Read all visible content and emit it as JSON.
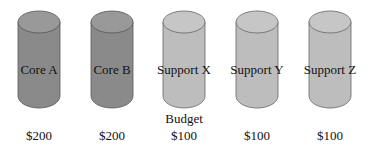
{
  "items": [
    {
      "label": "Core A",
      "amount": "$200",
      "color": "#8a8a8a",
      "top": "#999999"
    },
    {
      "label": "Core B",
      "amount": "$200",
      "color": "#8a8a8a",
      "top": "#999999"
    },
    {
      "label": "Support X",
      "amount": "$100",
      "color": "#bdbdbd",
      "top": "#c6c6c6"
    },
    {
      "label": "Support Y",
      "amount": "$100",
      "color": "#bdbdbd",
      "top": "#c6c6c6"
    },
    {
      "label": "Support Z",
      "amount": "$100",
      "color": "#bdbdbd",
      "top": "#c6c6c6"
    }
  ],
  "budget_label": "Budget"
}
